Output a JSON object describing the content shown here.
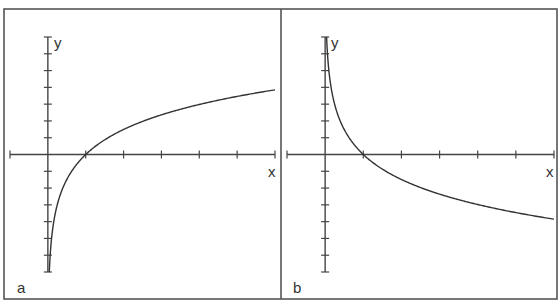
{
  "chart_data": [
    {
      "type": "line",
      "panel_label": "a",
      "title": "",
      "xlabel": "x",
      "ylabel": "y",
      "function": "logarithmic, increasing (y = k·ln x, k>0)",
      "x_intercept": 1,
      "xlim": [
        -1,
        6
      ],
      "ylim": [
        -7,
        7
      ],
      "x_ticks": [
        -1,
        0,
        1,
        2,
        3,
        4,
        5,
        6
      ],
      "y_ticks": [
        -7,
        -6,
        -5,
        -4,
        -3,
        -2,
        -1,
        0,
        1,
        2,
        3,
        4,
        5,
        6,
        7
      ],
      "tick_labels_shown": false,
      "grid": false,
      "series": [
        {
          "name": "curve",
          "coef": 2.15,
          "x": [
            0.05,
            0.1,
            0.25,
            0.5,
            1,
            2,
            3,
            4,
            5,
            6
          ],
          "y": [
            -6.4,
            -4.95,
            -2.98,
            -1.49,
            0,
            1.49,
            2.36,
            2.98,
            3.46,
            3.85
          ]
        }
      ]
    },
    {
      "type": "line",
      "panel_label": "b",
      "title": "",
      "xlabel": "x",
      "ylabel": "y",
      "function": "logarithmic, decreasing (y = -k·ln x, k>0)",
      "x_intercept": 1,
      "xlim": [
        -1,
        6
      ],
      "ylim": [
        -7,
        7
      ],
      "x_ticks": [
        -1,
        0,
        1,
        2,
        3,
        4,
        5,
        6
      ],
      "y_ticks": [
        -7,
        -6,
        -5,
        -4,
        -3,
        -2,
        -1,
        0,
        1,
        2,
        3,
        4,
        5,
        6,
        7
      ],
      "tick_labels_shown": false,
      "grid": false,
      "series": [
        {
          "name": "curve",
          "coef": -2.15,
          "x": [
            0.05,
            0.1,
            0.25,
            0.5,
            1,
            2,
            3,
            4,
            5,
            6
          ],
          "y": [
            6.4,
            4.95,
            2.98,
            1.49,
            0,
            -1.49,
            -2.36,
            -2.98,
            -3.46,
            -3.85
          ]
        }
      ]
    }
  ]
}
